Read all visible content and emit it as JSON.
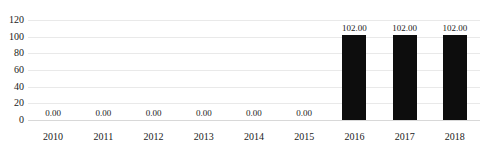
{
  "chart_data": {
    "type": "bar",
    "title": "",
    "subtitle": "",
    "xlabel": "",
    "ylabel": "",
    "categories": [
      "2010",
      "2011",
      "2012",
      "2013",
      "2014",
      "2015",
      "2016",
      "2017",
      "2018"
    ],
    "values": [
      0.0,
      0.0,
      0.0,
      0.0,
      0.0,
      0.0,
      102.0,
      102.0,
      102.0
    ],
    "data_labels": [
      "0.00",
      "0.00",
      "0.00",
      "0.00",
      "0.00",
      "0.00",
      "102.00",
      "102.00",
      "102.00"
    ],
    "ylim": [
      0,
      120
    ],
    "yticks": [
      0,
      20,
      40,
      60,
      80,
      100,
      120
    ],
    "ytick_labels": [
      "0",
      "20",
      "40",
      "60",
      "80",
      "100",
      "120"
    ],
    "grid": true,
    "legend": "none",
    "bar_color": "#0d0d0d",
    "gridline_color": "#e9e9e9",
    "background_color": "#ffffff",
    "text_color": "#1a1a1a"
  },
  "top_clipped_text": "——    ——"
}
